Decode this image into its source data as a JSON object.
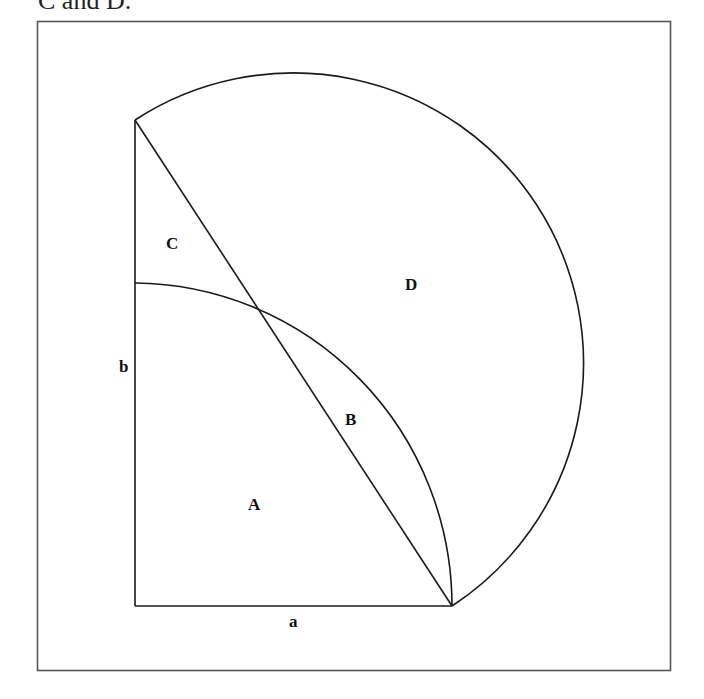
{
  "caption": "C and D.",
  "diagram": {
    "type": "geometry-figure",
    "labels": {
      "A": "A",
      "B": "B",
      "C": "C",
      "D": "D",
      "a": "a",
      "b": "b"
    },
    "regions": [
      "A",
      "B",
      "C",
      "D"
    ],
    "sides": [
      "a",
      "b"
    ],
    "stroke_color": "#1a1a1a",
    "frame_color": "#555555"
  }
}
